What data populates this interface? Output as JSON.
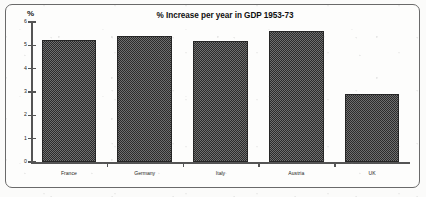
{
  "chart_data": {
    "type": "bar",
    "title": "% Increase per year in GDP 1953-73",
    "xlabel": "",
    "ylabel": "%",
    "ylim": [
      0,
      6
    ],
    "yticks": [
      0,
      1,
      2,
      3,
      4,
      5,
      6
    ],
    "ytick_labels": [
      "0",
      "1",
      "2",
      "3",
      "4",
      "5",
      "6"
    ],
    "grid": false,
    "legend": false,
    "categories": [
      "France",
      "Germany",
      "Italy",
      "Austria",
      "UK"
    ],
    "values": [
      5.25,
      5.4,
      5.2,
      5.6,
      2.9
    ],
    "series": [
      {
        "name": "% increase per year in GDP 1953-73",
        "values": [
          5.25,
          5.4,
          5.2,
          5.6,
          2.9
        ]
      }
    ],
    "bar_color": "#3d3d3d",
    "bar_fill": "checkerboard-dither",
    "axis_color": "#545454"
  },
  "figure": {
    "unit_label": "%",
    "frame_color": "#6a6a6a",
    "background": "#fdfdfc"
  }
}
